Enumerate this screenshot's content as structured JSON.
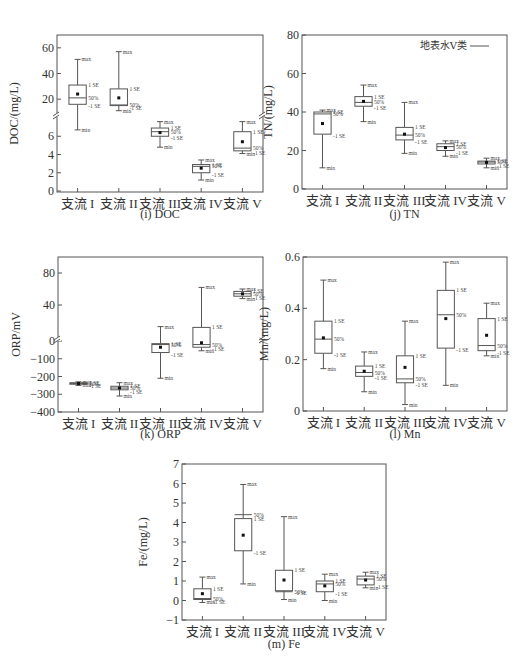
{
  "chart_data": [
    {
      "id": "doc",
      "type": "box",
      "title": "(i) DOC",
      "xlabel": "",
      "ylabel": "DOC/(mg/L)",
      "categories": [
        "支流 I",
        "支流 II",
        "支流 III",
        "支流 IV",
        "支流 V"
      ],
      "broken_axis": true,
      "upper_segment": {
        "ylim": [
          10,
          70
        ],
        "ticks": [
          20,
          40,
          60
        ]
      },
      "lower_segment": {
        "ylim": [
          0,
          8
        ],
        "ticks": [
          0,
          2,
          4,
          6
        ]
      },
      "boxes": [
        {
          "max": 51,
          "se_plus": 31,
          "median": 21,
          "se_minus": 16,
          "min": 6.7,
          "mean": 24
        },
        {
          "max": 57,
          "se_plus": 28,
          "median": 15.5,
          "se_minus": 15,
          "min": 11,
          "mean": 21
        },
        {
          "max": 7.6,
          "se_plus": 6.9,
          "median": 6.5,
          "se_minus": 6.0,
          "min": 4.8,
          "mean": 6.4
        },
        {
          "max": 3.4,
          "se_plus": 2.9,
          "median": 2.7,
          "se_minus": 2.0,
          "min": 1.2,
          "mean": 2.5
        },
        {
          "max": 7.6,
          "se_plus": 6.5,
          "median": 4.7,
          "se_minus": 4.4,
          "min": 4.1,
          "mean": 5.4
        }
      ]
    },
    {
      "id": "tn",
      "type": "box",
      "title": "(j) TN",
      "xlabel": "",
      "ylabel": "TN/(mg/L)",
      "categories": [
        "支流 I",
        "支流 II",
        "支流 III",
        "支流 IV",
        "支流 V"
      ],
      "ylim": [
        0,
        80
      ],
      "ticks": [
        0,
        20,
        40,
        60,
        80
      ],
      "legend": "地表水Ⅴ类",
      "boxes": [
        {
          "max": 41,
          "se_plus": 40,
          "median": 39,
          "se_minus": 28.5,
          "min": 11,
          "mean": 34
        },
        {
          "max": 54,
          "se_plus": 48,
          "median": 45,
          "se_minus": 43,
          "min": 35,
          "mean": 45.5
        },
        {
          "max": 45,
          "se_plus": 32,
          "median": 28,
          "se_minus": 25.5,
          "min": 18.5,
          "mean": 28.5
        },
        {
          "max": 25,
          "se_plus": 23.5,
          "median": 22,
          "se_minus": 20,
          "min": 17,
          "mean": 21.5
        },
        {
          "max": 16,
          "se_plus": 14.5,
          "median": 14,
          "se_minus": 13,
          "min": 11,
          "mean": 13.8
        }
      ]
    },
    {
      "id": "orp",
      "type": "box",
      "title": "(k) ORP",
      "xlabel": "",
      "ylabel": "ORP/mV",
      "categories": [
        "支流 I",
        "支流 II",
        "支流 III",
        "支流 IV",
        "支流 V"
      ],
      "broken_axis": true,
      "upper_segment": {
        "ylim": [
          0,
          100
        ],
        "ticks": [
          40,
          80
        ]
      },
      "lower_segment": {
        "ylim": [
          -400,
          0
        ],
        "ticks": [
          -400,
          -300,
          -200,
          -100,
          0
        ]
      },
      "boxes": [
        {
          "max": -230,
          "se_plus": -235,
          "median": -240,
          "se_minus": -243,
          "min": -250,
          "mean": -240
        },
        {
          "max": -235,
          "se_plus": -255,
          "median": -265,
          "se_minus": -275,
          "min": -310,
          "mean": -265
        },
        {
          "max": 13,
          "se_plus": -15,
          "median": -20,
          "se_minus": -65,
          "min": -210,
          "mean": -35
        },
        {
          "max": 62,
          "se_plus": 12,
          "median": -20,
          "se_minus": -35,
          "min": -55,
          "mean": -10
        },
        {
          "max": 60,
          "se_plus": 57,
          "median": 54,
          "se_minus": 51,
          "min": 48,
          "mean": 54
        }
      ]
    },
    {
      "id": "mn",
      "type": "box",
      "title": "(l) Mn",
      "xlabel": "",
      "ylabel": "Mn/(mg/L)",
      "categories": [
        "支流 I",
        "支流 II",
        "支流 III",
        "支流 IV",
        "支流 V"
      ],
      "ylim": [
        0,
        0.6
      ],
      "ticks": [
        0,
        0.2,
        0.4,
        0.6
      ],
      "boxes": [
        {
          "max": 0.51,
          "se_plus": 0.35,
          "median": 0.28,
          "se_minus": 0.225,
          "min": 0.165,
          "mean": 0.285
        },
        {
          "max": 0.23,
          "se_plus": 0.175,
          "median": 0.15,
          "se_minus": 0.135,
          "min": 0.075,
          "mean": 0.155
        },
        {
          "max": 0.35,
          "se_plus": 0.215,
          "median": 0.125,
          "se_minus": 0.11,
          "min": 0.025,
          "mean": 0.17
        },
        {
          "max": 0.58,
          "se_plus": 0.47,
          "median": 0.375,
          "se_minus": 0.245,
          "min": 0.1,
          "mean": 0.36
        },
        {
          "max": 0.42,
          "se_plus": 0.36,
          "median": 0.255,
          "se_minus": 0.235,
          "min": 0.215,
          "mean": 0.295
        }
      ]
    },
    {
      "id": "fe",
      "type": "box",
      "title": "(m) Fe",
      "xlabel": "",
      "ylabel": "Fe/(mg/L)",
      "categories": [
        "支流 I",
        "支流 II",
        "支流 III",
        "支流 IV",
        "支流 V"
      ],
      "ylim": [
        -1,
        7
      ],
      "ticks": [
        -1,
        0,
        1,
        2,
        3,
        4,
        5,
        6,
        7
      ],
      "boxes": [
        {
          "max": 1.2,
          "se_plus": 0.6,
          "median": 0.1,
          "se_minus": 0.05,
          "min": -0.1,
          "mean": 0.35
        },
        {
          "max": 5.95,
          "se_plus": 4.2,
          "median": 4.4,
          "se_minus": 2.55,
          "min": 0.85,
          "mean": 3.35
        },
        {
          "max": 4.3,
          "se_plus": 1.55,
          "median": 0.45,
          "se_minus": 0.5,
          "min": 0.05,
          "mean": 1.05
        },
        {
          "max": 1.35,
          "se_plus": 1.0,
          "median": 0.85,
          "se_minus": 0.45,
          "min": 0.0,
          "mean": 0.75
        },
        {
          "max": 1.45,
          "se_plus": 1.25,
          "median": 1.1,
          "se_minus": 0.8,
          "min": 0.65,
          "mean": 1.05
        }
      ]
    }
  ],
  "labels": {
    "max": "max",
    "min": "min",
    "se_plus": "1 SE",
    "se_minus": "-1 SE",
    "median": "50%"
  }
}
